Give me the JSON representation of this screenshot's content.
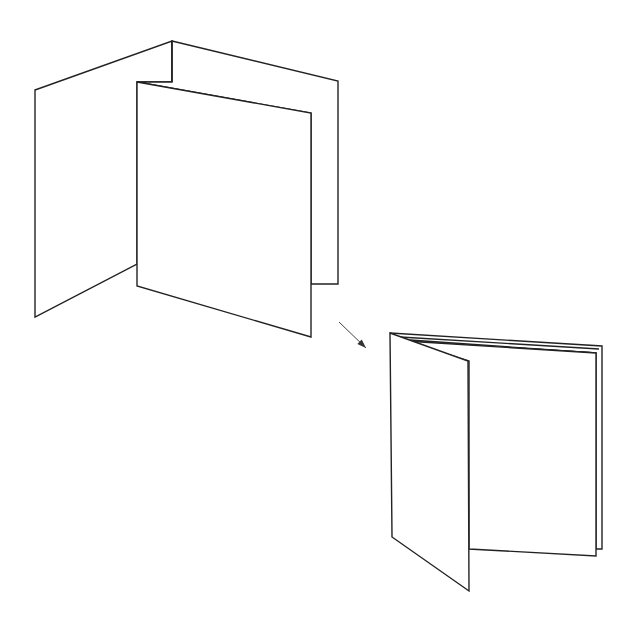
{
  "diagram": {
    "stroke_color": "#222222",
    "background": "#ffffff",
    "figures": [
      {
        "name": "accordion-fold",
        "label": "",
        "panels": [
          {
            "name": "back-left-panel",
            "points": "35,90 172,41 172,82 137,82 137,264 35,317"
          },
          {
            "name": "back-right-panel",
            "points": "172,41 338,81 338,284 311,284 311,113 137,82 172,82"
          },
          {
            "name": "front-panel",
            "points": "137,82 311,113 311,337 137,286"
          }
        ],
        "lines": [
          {
            "name": "fold-crease-center",
            "x1": 172,
            "y1": 41,
            "x2": 172,
            "y2": 82
          },
          {
            "name": "top-edge-back",
            "x1": 137,
            "y1": 82,
            "x2": 338,
            "y2": 81
          }
        ]
      },
      {
        "name": "folded-booklet",
        "label": "",
        "panels": [
          {
            "name": "outer-back-page",
            "points": "390,333 602,346 602,549 596,549 596,353 405,341"
          },
          {
            "name": "inner-page",
            "points": "405,341 596,353 596,556 469,549 469,361"
          },
          {
            "name": "front-flap",
            "points": "390,333 468,361 469,591 392,537"
          }
        ],
        "lines": [
          {
            "name": "page-edge-1",
            "x1": 400,
            "y1": 337,
            "x2": 599,
            "y2": 349
          },
          {
            "name": "page-edge-2",
            "x1": 410,
            "y1": 340,
            "x2": 596,
            "y2": 353
          }
        ]
      }
    ],
    "arrow": {
      "name": "transition-arrow",
      "x1": 339,
      "y1": 322,
      "x2": 366,
      "y2": 348
    }
  }
}
